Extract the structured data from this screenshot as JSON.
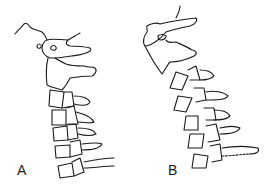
{
  "figure": {
    "panels": [
      {
        "label": "A",
        "description": "upright lateral view of cervical spine"
      },
      {
        "label": "B",
        "description": "flexed lateral view of cervical spine"
      }
    ],
    "colors": {
      "line": "#1a1a1a",
      "background": "#ffffff"
    }
  }
}
